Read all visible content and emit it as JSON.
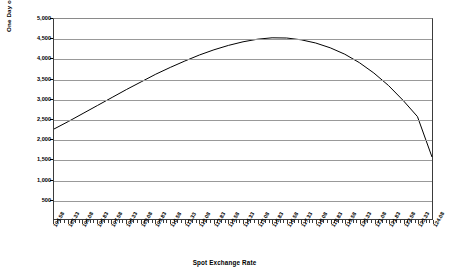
{
  "chart_data": {
    "type": "line",
    "title": "",
    "xlabel": "Spot Exchange Rate",
    "ylabel": "One Day of Time Decay",
    "grid": true,
    "legend": "none",
    "ylim": [
      0,
      5000
    ],
    "y_ticks": [
      500,
      1000,
      1500,
      2000,
      2500,
      3000,
      3500,
      4000,
      4500,
      5000
    ],
    "y_tick_labels": [
      "500",
      "1,000",
      "1,500",
      "2,000",
      "2,500",
      "3,000",
      "3,500",
      "4,000",
      "4,500",
      "5,000"
    ],
    "xlim": [
      104.58,
      124.08
    ],
    "x_tick_labels": [
      "104.58",
      "105.33",
      "106.08",
      "106.83",
      "107.58",
      "108.33",
      "109.08",
      "109.83",
      "110.58",
      "111.33",
      "112.08",
      "112.83",
      "113.58",
      "114.33",
      "115.08",
      "115.83",
      "116.58",
      "117.33",
      "118.08",
      "118.83",
      "119.58",
      "120.33",
      "121.08",
      "121.83",
      "122.58",
      "123.33",
      "124.08"
    ],
    "series": [
      {
        "name": "One Day of Time Decay",
        "color": "#000000",
        "x": [
          104.58,
          105.33,
          106.08,
          106.83,
          107.58,
          108.33,
          109.08,
          109.83,
          110.58,
          111.33,
          112.08,
          112.83,
          113.58,
          114.33,
          115.08,
          115.83,
          116.58,
          117.33,
          118.08,
          118.83,
          119.58,
          120.33,
          121.08,
          121.83,
          122.58,
          123.33,
          124.08
        ],
        "values": [
          2250,
          2440,
          2640,
          2840,
          3040,
          3240,
          3430,
          3620,
          3790,
          3950,
          4100,
          4230,
          4340,
          4430,
          4495,
          4530,
          4525,
          4480,
          4400,
          4280,
          4120,
          3910,
          3650,
          3340,
          2970,
          2560,
          1550
        ]
      }
    ]
  }
}
